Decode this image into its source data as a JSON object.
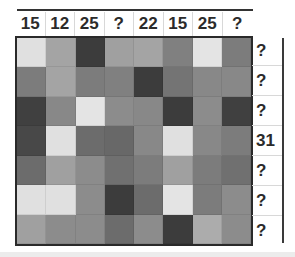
{
  "puzzle": {
    "column_clues": [
      "15",
      "12",
      "25",
      "?",
      "22",
      "15",
      "25",
      "?"
    ],
    "row_clues": [
      "?",
      "?",
      "?",
      "31",
      "?",
      "?",
      "?"
    ],
    "grid_rows": 7,
    "grid_cols": 8,
    "cells": [
      [
        "#e0e0e0",
        "#a4a4a4",
        "#3c3c3c",
        "#a0a0a0",
        "#a4a4a4",
        "#808080",
        "#e4e4e4",
        "#7c7c7c"
      ],
      [
        "#7c7c7c",
        "#a4a4a4",
        "#7c7c7c",
        "#808080",
        "#3c3c3c",
        "#747474",
        "#888888",
        "#888888"
      ],
      [
        "#404040",
        "#888888",
        "#e4e4e4",
        "#8c8c8c",
        "#888888",
        "#3c3c3c",
        "#8c8c8c",
        "#404040"
      ],
      [
        "#484848",
        "#e0e0e0",
        "#6c6c6c",
        "#686868",
        "#888888",
        "#e0e0e0",
        "#888888",
        "#7c7c7c"
      ],
      [
        "#6c6c6c",
        "#a0a0a0",
        "#8c8c8c",
        "#707070",
        "#7c7c7c",
        "#a0a0a0",
        "#7c7c7c",
        "#707070"
      ],
      [
        "#e0e0e0",
        "#e0e0e0",
        "#8c8c8c",
        "#3c3c3c",
        "#6c6c6c",
        "#e4e4e4",
        "#7c7c7c",
        "#8c8c8c"
      ],
      [
        "#a0a0a0",
        "#8c8c8c",
        "#8c8c8c",
        "#6c6c6c",
        "#8c8c8c",
        "#3c3c3c",
        "#acacac",
        "#8c8c8c"
      ]
    ]
  },
  "colors": {
    "background": "#ffffff",
    "text": "#2b2b2b",
    "border": "#2a2a2a"
  }
}
